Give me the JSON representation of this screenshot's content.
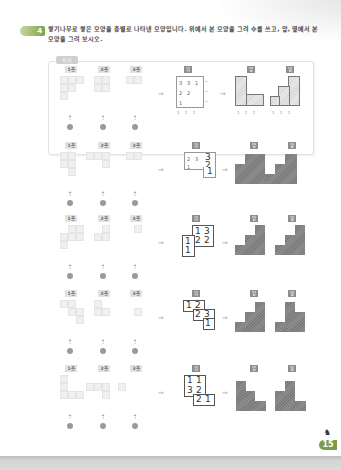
{
  "question": {
    "number": "4",
    "text": "쌓기나무로 쌓은 모양을 층별로 나타낸 모양입니다. 위에서 본 모양을 그려 수를 쓰고, 앞, 옆에서 본 모양을 그려 보시오."
  },
  "example": {
    "tag": "보기",
    "floor_labels": [
      "1층",
      "2층",
      "3층"
    ],
    "view_labels": {
      "top": "위",
      "front": "앞",
      "side": "옆"
    },
    "top_view_numbers": [
      [
        "3",
        "3",
        "1"
      ],
      [
        "2",
        "2"
      ],
      [
        "1"
      ]
    ],
    "front_counts": "1 1 1",
    "side_counts": "1 1 1",
    "front_view_counts": "1 1 1",
    "side_view_counts": "1 1 1"
  },
  "problems": [
    {
      "floor_labels": [
        "1층",
        "2층",
        "3층"
      ],
      "view_labels": {
        "top": "위",
        "front": "앞",
        "side": "옆"
      },
      "top_view_numbers": {
        "small": [
          "2",
          "3",
          "1"
        ],
        "large": [
          "3",
          "2",
          "1"
        ]
      }
    },
    {
      "floor_labels": [
        "1층",
        "2층",
        "3층"
      ],
      "view_labels": {
        "top": "위",
        "front": "앞",
        "side": "옆"
      },
      "top_view_numbers": [
        "1",
        "3",
        "1",
        "2",
        "2",
        "1"
      ]
    },
    {
      "floor_labels": [
        "1층",
        "2층",
        "3층"
      ],
      "view_labels": {
        "top": "위",
        "front": "앞",
        "side": "옆"
      },
      "top_view_numbers": [
        "1",
        "2",
        "2",
        "3",
        "1"
      ]
    },
    {
      "floor_labels": [
        "1층",
        "2층",
        "3층"
      ],
      "view_labels": {
        "top": "위",
        "front": "앞",
        "side": "옆"
      },
      "top_view_numbers": [
        "1",
        "1",
        "3",
        "2",
        "2",
        "1"
      ]
    }
  ],
  "symbols": {
    "arrow_right": "⇒",
    "arrow_up": "⇡",
    "eye": "eye-icon"
  },
  "page": {
    "number": "15"
  },
  "colors": {
    "accent_green": "#7da54a",
    "solid_gray": "#7a7a7a",
    "label_gray": "#8d8d8d"
  }
}
